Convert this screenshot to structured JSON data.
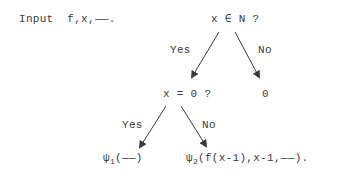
{
  "diagram": {
    "input_line": "Input  f,x,——.",
    "root_question": "x ∈ N ?",
    "root_yes_label": "Yes",
    "root_no_label": "No",
    "zero_question": "x = 0 ?",
    "no_result": "0",
    "zero_yes_label": "Yes",
    "zero_no_label": "No",
    "leaf_psi1": {
      "symbol": "ψ",
      "subscript": "1",
      "args": "(——)"
    },
    "leaf_psi2": {
      "symbol": "ψ",
      "subscript": "2",
      "args": "(f(x-1),x-1,——)."
    }
  }
}
